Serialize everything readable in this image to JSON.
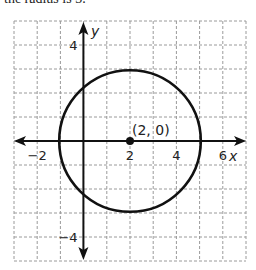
{
  "header": {
    "text": "the radius is 3."
  },
  "graph": {
    "x_range": [
      -3,
      7
    ],
    "y_range": [
      -5,
      5
    ],
    "x_axis_label": "x",
    "y_axis_label": "y",
    "x_ticks": [
      {
        "value": -2,
        "label": "−2"
      },
      {
        "value": 2,
        "label": "2"
      },
      {
        "value": 4,
        "label": "4"
      },
      {
        "value": 6,
        "label": "6"
      }
    ],
    "y_ticks": [
      {
        "value": 4,
        "label": "4"
      },
      {
        "value": -4,
        "label": "−4"
      }
    ],
    "circle": {
      "center": [
        2,
        0
      ],
      "radius": 3
    },
    "point": {
      "coords": [
        2,
        0
      ],
      "label": "(2, 0)"
    },
    "colors": {
      "grid": "#9a9a9a",
      "axis": "#111111",
      "curve": "#111111"
    }
  }
}
